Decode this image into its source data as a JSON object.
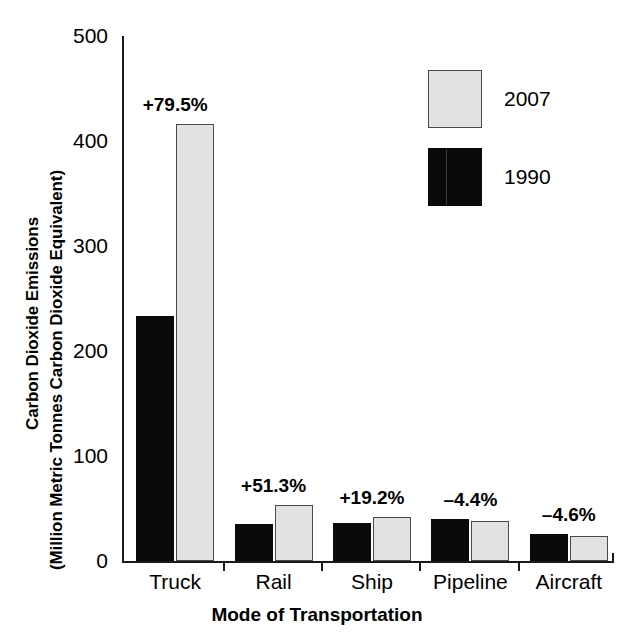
{
  "chart_data": {
    "type": "bar",
    "title": "",
    "xlabel": "Mode of Transportation",
    "ylabel": "Carbon Dioxide Emissions (Million Metric Tonnes Carbon Dioxide Equivalent)",
    "ylabel_line1": "Carbon Dioxide Emissions",
    "ylabel_line2": "(Million Metric Tonnes Carbon Dioxide Equivalent)",
    "ylim": [
      0,
      500
    ],
    "yticks": [
      0,
      100,
      200,
      300,
      400,
      500
    ],
    "ytick_labels": [
      "0",
      "100",
      "200",
      "300",
      "400",
      "500"
    ],
    "grid": false,
    "legend_position": "upper-right",
    "categories": [
      "Truck",
      "Rail",
      "Ship",
      "Pipeline",
      "Aircraft"
    ],
    "series": [
      {
        "name": "1990",
        "color": "#0a0a0a",
        "values": [
          233,
          35,
          36,
          40,
          26
        ]
      },
      {
        "name": "2007",
        "color": "#e2e2e2",
        "values": [
          416,
          53,
          42,
          38,
          24
        ]
      }
    ],
    "annotations": [
      {
        "category": "Truck",
        "text": "+79.5%"
      },
      {
        "category": "Rail",
        "text": "+51.3%"
      },
      {
        "category": "Ship",
        "text": "+19.2%"
      },
      {
        "category": "Pipeline",
        "text": "–4.4%"
      },
      {
        "category": "Aircraft",
        "text": "–4.6%"
      }
    ]
  },
  "legend": {
    "items": [
      {
        "label": "2007",
        "swatch": "light-gray"
      },
      {
        "label": "1990",
        "swatch": "black"
      }
    ]
  }
}
